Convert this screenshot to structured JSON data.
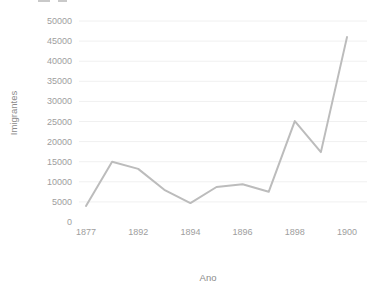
{
  "chart_data": {
    "type": "line",
    "title": "",
    "xlabel": "Ano",
    "ylabel": "Imigrantes",
    "ylim": [
      0,
      50000
    ],
    "y_ticks": [
      0,
      5000,
      10000,
      15000,
      20000,
      25000,
      30000,
      35000,
      40000,
      45000,
      50000
    ],
    "x_tick_labels": [
      "1877",
      "1892",
      "1894",
      "1896",
      "1898",
      "1900"
    ],
    "grid": true,
    "legend": "none",
    "colors": {
      "line": "#bcbcbc",
      "gridline": "#f0f0f0",
      "tick_label": "#9e9e9e",
      "axis_title": "#8a8a8a",
      "background": "#ffffff"
    },
    "series": [
      {
        "name": "Imigrantes",
        "points": [
          {
            "year": "1877",
            "labeled": true,
            "value": 4000
          },
          {
            "year": "",
            "labeled": false,
            "value": 15000
          },
          {
            "year": "1892",
            "labeled": true,
            "value": 13200
          },
          {
            "year": "",
            "labeled": false,
            "value": 8000
          },
          {
            "year": "1894",
            "labeled": true,
            "value": 4700
          },
          {
            "year": "",
            "labeled": false,
            "value": 8700
          },
          {
            "year": "1896",
            "labeled": true,
            "value": 9400
          },
          {
            "year": "",
            "labeled": false,
            "value": 7500
          },
          {
            "year": "1898",
            "labeled": true,
            "value": 25100
          },
          {
            "year": "",
            "labeled": false,
            "value": 17400
          },
          {
            "year": "1900",
            "labeled": true,
            "value": 46000
          }
        ]
      }
    ]
  }
}
